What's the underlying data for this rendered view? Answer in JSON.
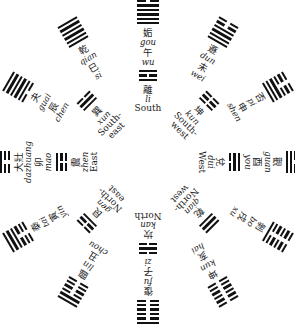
{
  "center": {
    "x": 148,
    "y": 162
  },
  "hexagrams": [
    {
      "zh": "姤",
      "pinyin": "gou",
      "branch_zh": "午",
      "branch_py": "wu",
      "angle": 0,
      "lines": [
        1,
        1,
        1,
        1,
        1,
        0
      ]
    },
    {
      "zh": "遯",
      "pinyin": "dun",
      "branch_zh": "未",
      "branch_py": "wei",
      "angle": 30,
      "lines": [
        1,
        1,
        1,
        1,
        0,
        0
      ]
    },
    {
      "zh": "否",
      "pinyin": "pi",
      "branch_zh": "申",
      "branch_py": "shen",
      "angle": 60,
      "lines": [
        1,
        1,
        1,
        0,
        0,
        0
      ]
    },
    {
      "zh": "觀",
      "pinyin": "guan",
      "branch_zh": "酉",
      "branch_py": "you",
      "angle": 90,
      "lines": [
        1,
        1,
        0,
        0,
        0,
        0
      ]
    },
    {
      "zh": "剝",
      "pinyin": "bo",
      "branch_zh": "戌",
      "branch_py": "xu",
      "angle": 120,
      "lines": [
        1,
        0,
        0,
        0,
        0,
        0
      ]
    },
    {
      "zh": "坤",
      "pinyin": "kun",
      "branch_zh": "亥",
      "branch_py": "hai",
      "angle": 150,
      "lines": [
        0,
        0,
        0,
        0,
        0,
        0
      ]
    },
    {
      "zh": "復",
      "pinyin": "fu",
      "branch_zh": "子",
      "branch_py": "zi",
      "angle": 180,
      "lines": [
        0,
        0,
        0,
        0,
        0,
        1
      ]
    },
    {
      "zh": "臨",
      "pinyin": "lin",
      "branch_zh": "丑",
      "branch_py": "chou",
      "angle": 210,
      "lines": [
        0,
        0,
        0,
        0,
        1,
        1
      ]
    },
    {
      "zh": "泰",
      "pinyin": "tai",
      "branch_zh": "寅",
      "branch_py": "yin",
      "angle": 240,
      "lines": [
        0,
        0,
        0,
        1,
        1,
        1
      ]
    },
    {
      "zh": "大壯",
      "pinyin": "dazhuang",
      "branch_zh": "卯",
      "branch_py": "mao",
      "angle": 270,
      "lines": [
        0,
        0,
        1,
        1,
        1,
        1
      ]
    },
    {
      "zh": "夬",
      "pinyin": "guai",
      "branch_zh": "辰",
      "branch_py": "chen",
      "angle": 300,
      "lines": [
        0,
        1,
        1,
        1,
        1,
        1
      ]
    },
    {
      "zh": "乾",
      "pinyin": "qian",
      "branch_zh": "巳",
      "branch_py": "si",
      "angle": 330,
      "lines": [
        1,
        1,
        1,
        1,
        1,
        1
      ]
    }
  ],
  "trigrams": [
    {
      "zh": "離",
      "pinyin": "li",
      "dir": "South",
      "angle": 0,
      "lines": [
        1,
        0,
        1
      ]
    },
    {
      "zh": "坤",
      "pinyin": "kun",
      "dir": "South-west",
      "angle": 45,
      "lines": [
        0,
        0,
        0
      ]
    },
    {
      "zh": "兌",
      "pinyin": "dui",
      "dir": "West",
      "angle": 90,
      "lines": [
        0,
        1,
        1
      ]
    },
    {
      "zh": "乾",
      "pinyin": "qian",
      "dir": "North-west",
      "angle": 135,
      "lines": [
        1,
        1,
        1
      ]
    },
    {
      "zh": "坎",
      "pinyin": "kan",
      "dir": "North",
      "angle": 180,
      "lines": [
        0,
        1,
        0
      ]
    },
    {
      "zh": "艮",
      "pinyin": "gen",
      "dir": "North-east",
      "angle": 225,
      "lines": [
        1,
        0,
        0
      ]
    },
    {
      "zh": "震",
      "pinyin": "zhen",
      "dir": "East",
      "angle": 270,
      "lines": [
        0,
        0,
        1
      ]
    },
    {
      "zh": "巽",
      "pinyin": "xun",
      "dir": "South-east",
      "angle": 315,
      "lines": [
        1,
        1,
        0
      ]
    }
  ]
}
